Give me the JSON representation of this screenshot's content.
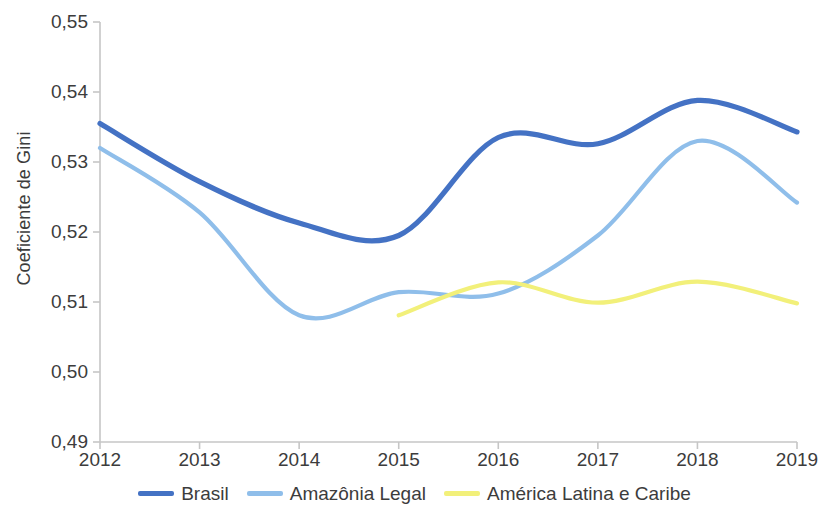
{
  "chart_data": {
    "type": "line",
    "title": "",
    "subtitle": "",
    "xlabel": "",
    "ylabel": "Coeficiente de Gini",
    "x": [
      2012,
      2013,
      2014,
      2015,
      2016,
      2017,
      2018,
      2019
    ],
    "xticklabels": [
      "2012",
      "2013",
      "2014",
      "2015",
      "2016",
      "2017",
      "2018",
      "2019"
    ],
    "yticklabels": [
      "0,49",
      "0,50",
      "0,51",
      "0,52",
      "0,53",
      "0,54",
      "0,55"
    ],
    "ytickvalues": [
      0.49,
      0.5,
      0.51,
      0.52,
      0.53,
      0.54,
      0.55
    ],
    "xlim": [
      2012,
      2019
    ],
    "ylim": [
      0.49,
      0.55
    ],
    "grid": false,
    "legend_position": "bottom",
    "decimal_separator": ",",
    "series": [
      {
        "name": "Brasil",
        "color": "#4472C4",
        "x": [
          2012,
          2013,
          2014,
          2015,
          2016,
          2017,
          2018,
          2019
        ],
        "values": [
          0.5355,
          0.5272,
          0.5213,
          0.5195,
          0.5335,
          0.5326,
          0.5388,
          0.5343
        ]
      },
      {
        "name": "Amazônia Legal",
        "color": "#8FBEEA",
        "x": [
          2012,
          2013,
          2014,
          2015,
          2016,
          2017,
          2018,
          2019
        ],
        "values": [
          0.532,
          0.5228,
          0.5081,
          0.5114,
          0.5112,
          0.5195,
          0.533,
          0.5242
        ]
      },
      {
        "name": "América Latina e Caribe",
        "color": "#F2F07A",
        "x": [
          2015,
          2016,
          2017,
          2018,
          2019
        ],
        "values": [
          0.5081,
          0.5128,
          0.5099,
          0.5129,
          0.5098
        ]
      }
    ]
  },
  "legend": {
    "items": [
      {
        "label": "Brasil",
        "color": "#4472C4"
      },
      {
        "label": "Amazônia Legal",
        "color": "#8FBEEA"
      },
      {
        "label": "América Latina e Caribe",
        "color": "#F2F07A"
      }
    ]
  },
  "axes": {
    "y_axis_title": "Coeficiente de Gini"
  }
}
